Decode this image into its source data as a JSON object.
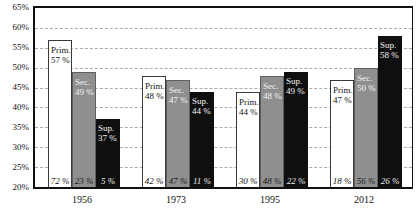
{
  "chart_data": {
    "type": "bar",
    "title": "",
    "categories": [
      "1956",
      "1973",
      "1995",
      "2012"
    ],
    "series": [
      {
        "name": "Prim.",
        "color": "#ffffff",
        "values": [
          57,
          48,
          44,
          47
        ],
        "footer_values": [
          72,
          42,
          30,
          18
        ]
      },
      {
        "name": "Sec.",
        "color": "#8f8f8f",
        "values": [
          49,
          47,
          48,
          50
        ],
        "footer_values": [
          23,
          47,
          48,
          56
        ]
      },
      {
        "name": "Sup.",
        "color": "#0f0f0f",
        "values": [
          37,
          44,
          49,
          58
        ],
        "footer_values": [
          5,
          11,
          22,
          26
        ]
      }
    ],
    "xlabel": "",
    "ylabel": "",
    "ylim": [
      20,
      65
    ],
    "ytick_step": 5,
    "ytick_labels": [
      "65%",
      "60%",
      "55%",
      "50%",
      "45%",
      "40%",
      "35%",
      "30%",
      "25%",
      "20%"
    ],
    "grid": "horizontal dashed",
    "legend_position": "none (series names printed inside bars)",
    "annotation_note": "italic percentages at bar bases are the shares printed under each bar"
  },
  "groups": [
    {
      "year": "1956",
      "bars": [
        {
          "series": "Prim.",
          "label_line1": "Prim.",
          "label_line2": "57 %",
          "footer": "72 %"
        },
        {
          "series": "Sec.",
          "label_line1": "Sec.",
          "label_line2": "49 %",
          "footer": "23 %"
        },
        {
          "series": "Sup.",
          "label_line1": "Sup.",
          "label_line2": "37 %",
          "footer": "5 %"
        }
      ]
    },
    {
      "year": "1973",
      "bars": [
        {
          "series": "Prim.",
          "label_line1": "Prim.",
          "label_line2": "48 %",
          "footer": "42 %"
        },
        {
          "series": "Sec.",
          "label_line1": "Sec.",
          "label_line2": "47 %",
          "footer": "47 %"
        },
        {
          "series": "Sup.",
          "label_line1": "Sup.",
          "label_line2": "44 %",
          "footer": "11 %"
        }
      ]
    },
    {
      "year": "1995",
      "bars": [
        {
          "series": "Prim.",
          "label_line1": "Prim.",
          "label_line2": "44 %",
          "footer": "30 %"
        },
        {
          "series": "Sec.",
          "label_line1": "Sec.",
          "label_line2": "48 %",
          "footer": "48 %"
        },
        {
          "series": "Sup.",
          "label_line1": "Sup.",
          "label_line2": "49 %",
          "footer": "22 %"
        }
      ]
    },
    {
      "year": "2012",
      "bars": [
        {
          "series": "Prim.",
          "label_line1": "Prim.",
          "label_line2": "47 %",
          "footer": "18 %"
        },
        {
          "series": "Sec.",
          "label_line1": "Sec.",
          "label_line2": "50 %",
          "footer": "56 %"
        },
        {
          "series": "Sup.",
          "label_line1": "Sup.",
          "label_line2": "58 %",
          "footer": "26 %"
        }
      ]
    }
  ],
  "colors": {
    "bar_primary": "#ffffff",
    "bar_secondary": "#8f8f8f",
    "bar_superior": "#0f0f0f",
    "frame": "#101010",
    "gridline": "#acacac",
    "background": "#ffffff"
  }
}
